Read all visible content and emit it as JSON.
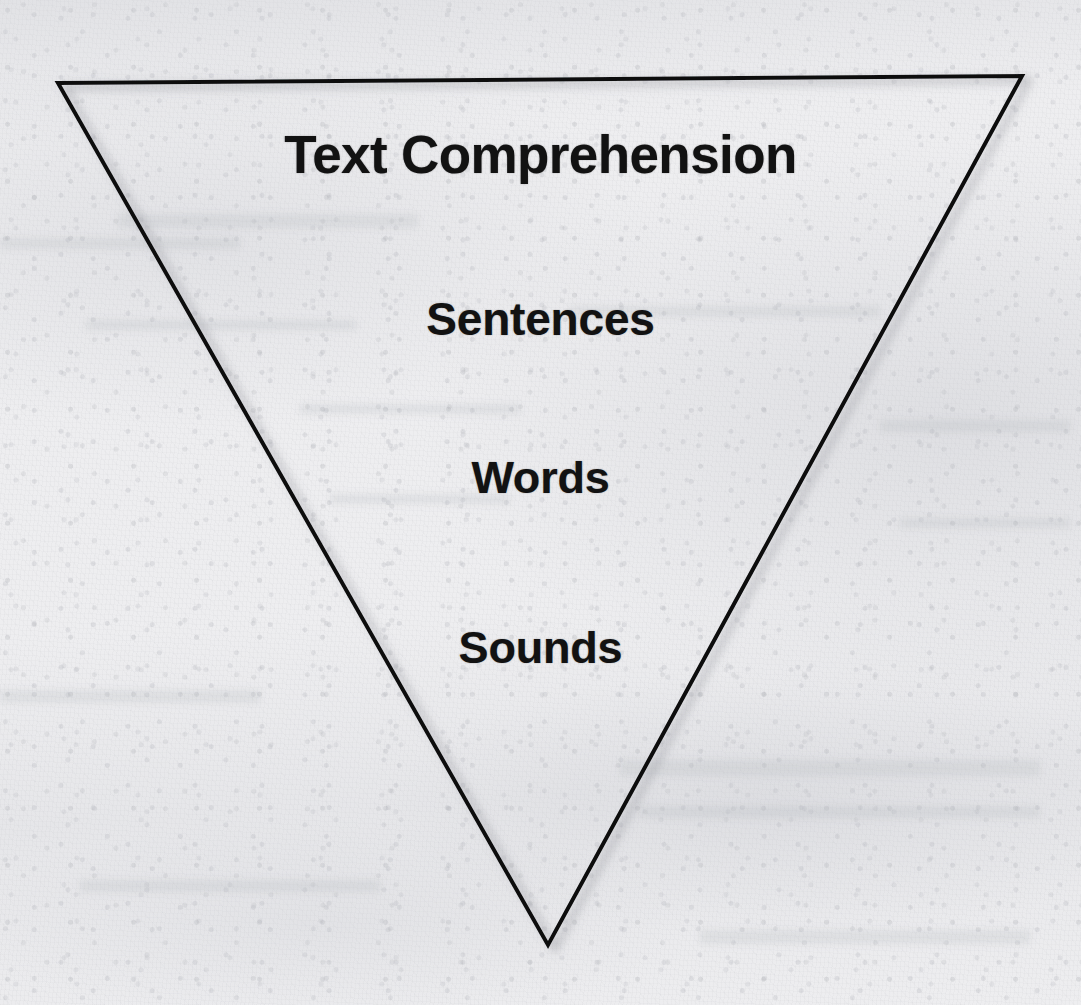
{
  "diagram": {
    "type": "inverted-triangle-hierarchy",
    "title": "Text Comprehension",
    "shape": {
      "name": "inverted-triangle",
      "fill": "none",
      "stroke_color": "#101010",
      "stroke_width": 4,
      "vertices": [
        {
          "name": "top-left",
          "x": 58,
          "y": 83
        },
        {
          "name": "top-right",
          "x": 1022,
          "y": 76
        },
        {
          "name": "bottom-apex",
          "x": 548,
          "y": 945
        }
      ]
    },
    "levels": [
      {
        "order": 1,
        "label": "Text Comprehension",
        "font_size": 53
      },
      {
        "order": 2,
        "label": "Sentences",
        "font_size": 46
      },
      {
        "order": 3,
        "label": "Words",
        "font_size": 45
      },
      {
        "order": 4,
        "label": "Sounds",
        "font_size": 45
      }
    ],
    "colors": {
      "text": "#121212",
      "outline": "#101010",
      "paper": "#eeeef0"
    }
  }
}
